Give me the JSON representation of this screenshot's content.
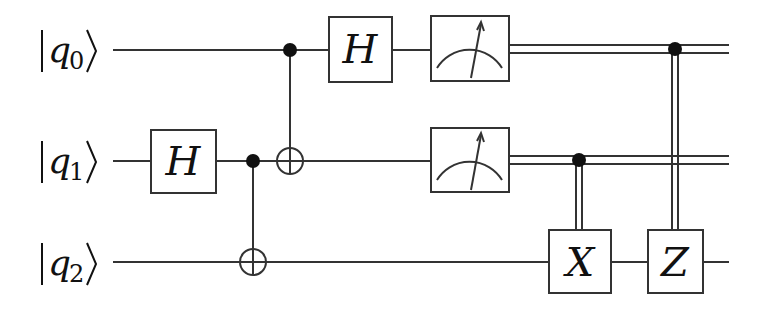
{
  "diagram": {
    "type": "quantum-circuit",
    "qubits": [
      {
        "id": "q0",
        "label_base": "q",
        "label_sub": "0",
        "y": 50
      },
      {
        "id": "q1",
        "label_base": "q",
        "label_sub": "1",
        "y": 161
      },
      {
        "id": "q2",
        "label_base": "q",
        "label_sub": "2",
        "y": 262
      }
    ],
    "gates": {
      "h_q1": {
        "label": "H",
        "qubit": "q1"
      },
      "cnot_q1_q2": {
        "control": "q1",
        "target": "q2"
      },
      "cnot_q0_q1": {
        "control": "q0",
        "target": "q1"
      },
      "h_q0": {
        "label": "H",
        "qubit": "q0"
      },
      "measure_q0": {
        "qubit": "q0",
        "kind": "measurement"
      },
      "measure_q1": {
        "qubit": "q1",
        "kind": "measurement"
      },
      "cx_q2": {
        "label": "X",
        "qubit": "q2",
        "classical_control": "q1"
      },
      "cz_q2": {
        "label": "Z",
        "qubit": "q2",
        "classical_control": "q0"
      }
    },
    "colors": {
      "line": "#333333",
      "background": "#ffffff"
    }
  }
}
